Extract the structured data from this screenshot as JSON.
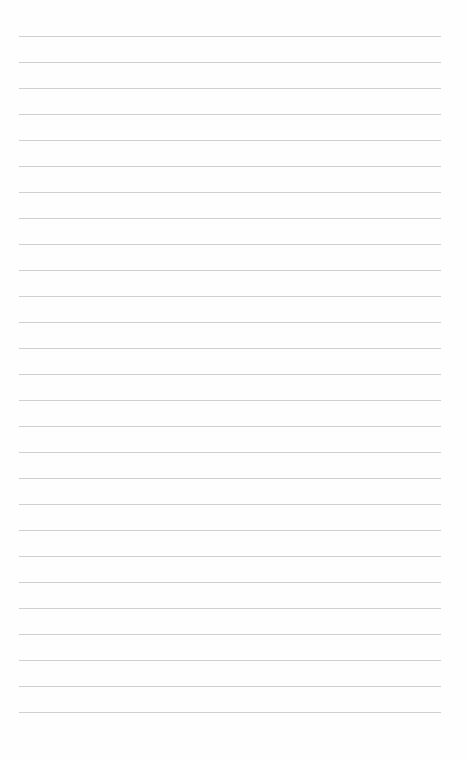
{
  "page": {
    "type": "lined-paper",
    "background_color": "#fefefe",
    "line_color": "#cfcfcf",
    "line_count": 27,
    "first_line_y": 36,
    "line_spacing": 26,
    "line_left": 19,
    "line_width": 422
  }
}
